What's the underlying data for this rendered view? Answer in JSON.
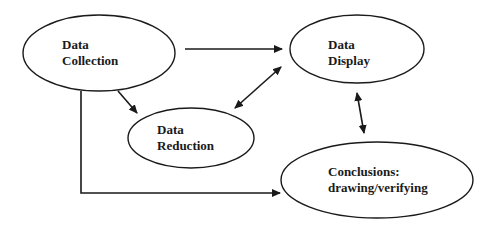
{
  "diagram": {
    "title": "",
    "nodes": [
      {
        "id": "collection",
        "line1": "Data",
        "line2": "Collection"
      },
      {
        "id": "display",
        "line1": "Data",
        "line2": "Display"
      },
      {
        "id": "reduction",
        "line1": "Data",
        "line2": "Reduction"
      },
      {
        "id": "conclusions",
        "line1": "Conclusions:",
        "line2": "drawing/verifying"
      }
    ],
    "edges": [
      {
        "from": "collection",
        "to": "display",
        "type": "arrow"
      },
      {
        "from": "collection",
        "to": "reduction",
        "type": "arrow"
      },
      {
        "from": "reduction",
        "to": "display",
        "type": "double-arrow"
      },
      {
        "from": "display",
        "to": "conclusions",
        "type": "double-arrow"
      },
      {
        "from": "collection",
        "to": "conclusions",
        "type": "elbow-arrow"
      }
    ],
    "colors": {
      "stroke": "#1a1a1a",
      "background": "#ffffff"
    }
  }
}
